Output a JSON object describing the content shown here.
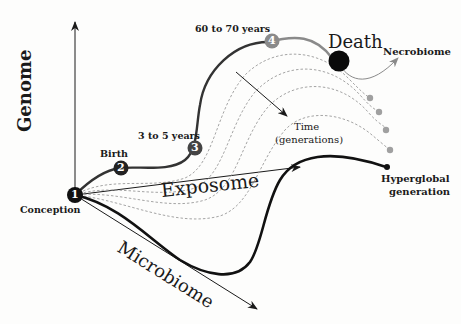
{
  "axes": {
    "genome": "Genome",
    "exposome": "Exposome",
    "microbiome": "Microbiome"
  },
  "stages": [
    {
      "number": "1",
      "label": "Conception"
    },
    {
      "number": "2",
      "label": "Birth"
    },
    {
      "number": "3",
      "label": "3 to 5 years"
    },
    {
      "number": "4",
      "label": "60 to 70 years"
    },
    {
      "number": "",
      "label": "Death"
    }
  ],
  "annotations": {
    "necrobiome": "Necrobiome",
    "time_line1": "Time",
    "time_line2": "(generations)",
    "hyperglobal_line1": "Hyperglobal",
    "hyperglobal_line2": "generation"
  },
  "colors": {
    "ink": "#1a1a1a",
    "life_curve": "#555555",
    "late_life": "#8a8a8a",
    "dashed": "#9a9a9a",
    "generation_dots": "#a0a0a0"
  }
}
